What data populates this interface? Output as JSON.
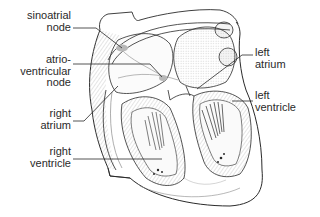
{
  "diagram": {
    "colors": {
      "background": "#ffffff",
      "outline": "#2a2a2a",
      "shading": "#9a9a9a",
      "node_highlight": "#b8b8b8",
      "label_text": "#2a2a2a"
    },
    "labels": {
      "sinoatrial_node": {
        "line1": "sinoatrial",
        "line2": "node"
      },
      "atrioventricular_node": {
        "line1": "atrio-",
        "line2": "ventricular",
        "line3": "node"
      },
      "right_atrium": {
        "line1": "right",
        "line2": "atrium"
      },
      "right_ventricle": {
        "line1": "right",
        "line2": "ventricle"
      },
      "left_atrium": {
        "line1": "left",
        "line2": "atrium"
      },
      "left_ventricle": {
        "line1": "left",
        "line2": "ventricle"
      }
    }
  }
}
